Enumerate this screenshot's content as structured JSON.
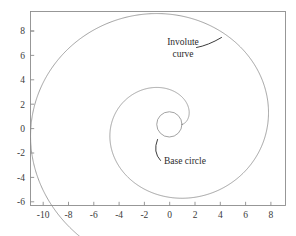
{
  "figure": {
    "kind": "involute-spiral-plot",
    "background_color": "#ffffff",
    "axis_color": "#8d8d8d",
    "curve_color": "#8a8a8a",
    "leader_color": "#3c3c3c",
    "text_color": "#2b2b2b"
  },
  "annotations": {
    "involute": {
      "line1": "Involute",
      "line2": "curve"
    },
    "base_circle": {
      "text": "Base circle"
    }
  },
  "chart_data": {
    "type": "line",
    "title": "",
    "xlabel": "",
    "ylabel": "",
    "xlim": [
      -11.0,
      9.2
    ],
    "ylim": [
      -6.9,
      9.6
    ],
    "grid": false,
    "legend": null,
    "xticks": [
      -10,
      -8,
      -6,
      -4,
      -2,
      0,
      2,
      4,
      6,
      8
    ],
    "xticklabels": [
      "-10",
      "-8",
      "-6",
      "-4",
      "-2",
      "0",
      "2",
      "4",
      "6",
      "8"
    ],
    "yticks": [
      8,
      6,
      4,
      2,
      0,
      -2,
      -4,
      -6
    ],
    "yticklabels": [
      "8",
      "6",
      "4",
      "2",
      "0",
      "-2",
      "-4",
      "-6"
    ],
    "series": [
      {
        "name": "Base circle",
        "type": "circle",
        "center": [
          0,
          0
        ],
        "radius": 1.0
      },
      {
        "name": "Involute curve",
        "type": "involute_of_circle",
        "base_radius": 1.0,
        "t_start": 0.0,
        "t_end": 12.8,
        "start_point": [
          1.0,
          0.0
        ],
        "end_point": [
          -9.4,
          4.4
        ],
        "extent_max_x": 7.9,
        "extent_min_x": -9.4,
        "extent_max_y": 9.5,
        "extent_min_y": -6.3
      }
    ],
    "annotations": [
      {
        "text": "Involute curve",
        "text_xy": [
          1.6,
          6.9
        ],
        "target_xy": [
          3.7,
          7.6
        ],
        "leader": "curved"
      },
      {
        "text": "Base circle",
        "text_xy": [
          -0.3,
          -2.0
        ],
        "target_xy": [
          -0.85,
          -0.6
        ],
        "leader": "curved"
      }
    ]
  }
}
